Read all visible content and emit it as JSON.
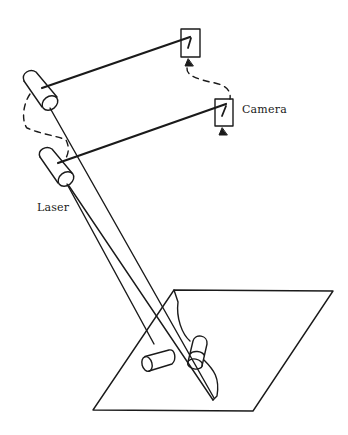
{
  "diagram": {
    "type": "schematic",
    "labels": {
      "laser": "Laser",
      "camera": "Camera"
    },
    "components": [
      {
        "name": "laser-upper",
        "kind": "laser"
      },
      {
        "name": "laser-lower",
        "kind": "laser"
      },
      {
        "name": "camera-upper",
        "kind": "camera"
      },
      {
        "name": "camera-lower",
        "kind": "camera"
      },
      {
        "name": "robot-arm",
        "kind": "arm"
      },
      {
        "name": "work-plane",
        "kind": "surface"
      },
      {
        "name": "object-cylinder-horizontal",
        "kind": "object"
      },
      {
        "name": "gripper-cylinder",
        "kind": "object"
      }
    ],
    "connections": [
      {
        "from": "laser-upper",
        "to": "camera-upper",
        "style": "solid-beam"
      },
      {
        "from": "laser-lower",
        "to": "camera-lower",
        "style": "solid-beam"
      },
      {
        "from": "camera-upper",
        "to": "camera-lower",
        "style": "dashed"
      },
      {
        "from": "laser-upper",
        "to": "laser-lower",
        "style": "dashed"
      }
    ],
    "colors": {
      "ink": "#1a1a1a",
      "background": "#ffffff"
    }
  }
}
